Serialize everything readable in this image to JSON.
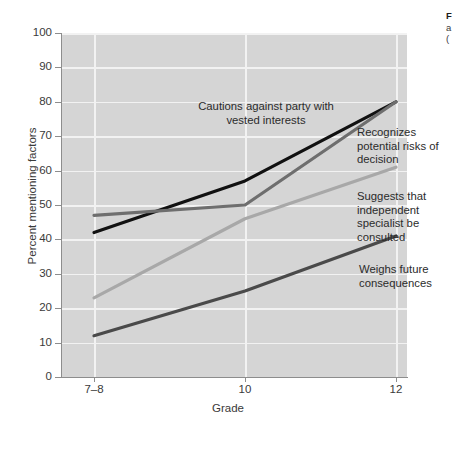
{
  "chart_data": {
    "type": "line",
    "title": "",
    "xlabel": "Grade",
    "ylabel": "Percent mentioning factors",
    "categories": [
      "7–8",
      "10",
      "12"
    ],
    "x": [
      0,
      1,
      2
    ],
    "ylim": [
      0,
      100
    ],
    "yticks": [
      0,
      10,
      20,
      30,
      40,
      50,
      60,
      70,
      80,
      90,
      100
    ],
    "ytick_labels": [
      "0",
      "10",
      "20",
      "30",
      "40",
      "50",
      "60",
      "70",
      "80",
      "90",
      "100"
    ],
    "grid": true,
    "legend": "inline-annotations",
    "plot_background": "#d5d5d5",
    "gridline_color": "#f2f2f2",
    "series": [
      {
        "name": "Cautions against party with vested interests",
        "color": "#111111",
        "values": [
          42,
          57,
          80
        ]
      },
      {
        "name": "Recognizes potential risks of decision",
        "color": "#6e6e6e",
        "values": [
          47,
          50,
          80
        ]
      },
      {
        "name": "Suggests that independent specialist be consulted",
        "color": "#a8a8a8",
        "values": [
          23,
          46,
          61
        ]
      },
      {
        "name": "Weighs future consequences",
        "color": "#4a4a4a",
        "values": [
          12,
          25,
          41
        ]
      }
    ]
  },
  "annotations": {
    "cautions": "Cautions against party with vested interests",
    "recognizes": "Recognizes potential risks of decision",
    "suggests": "Suggests that independent specialist be consulted",
    "weighs": "Weighs future consequences"
  },
  "caption": {
    "figure_label": "F",
    "line2": "a",
    "line3": "("
  }
}
